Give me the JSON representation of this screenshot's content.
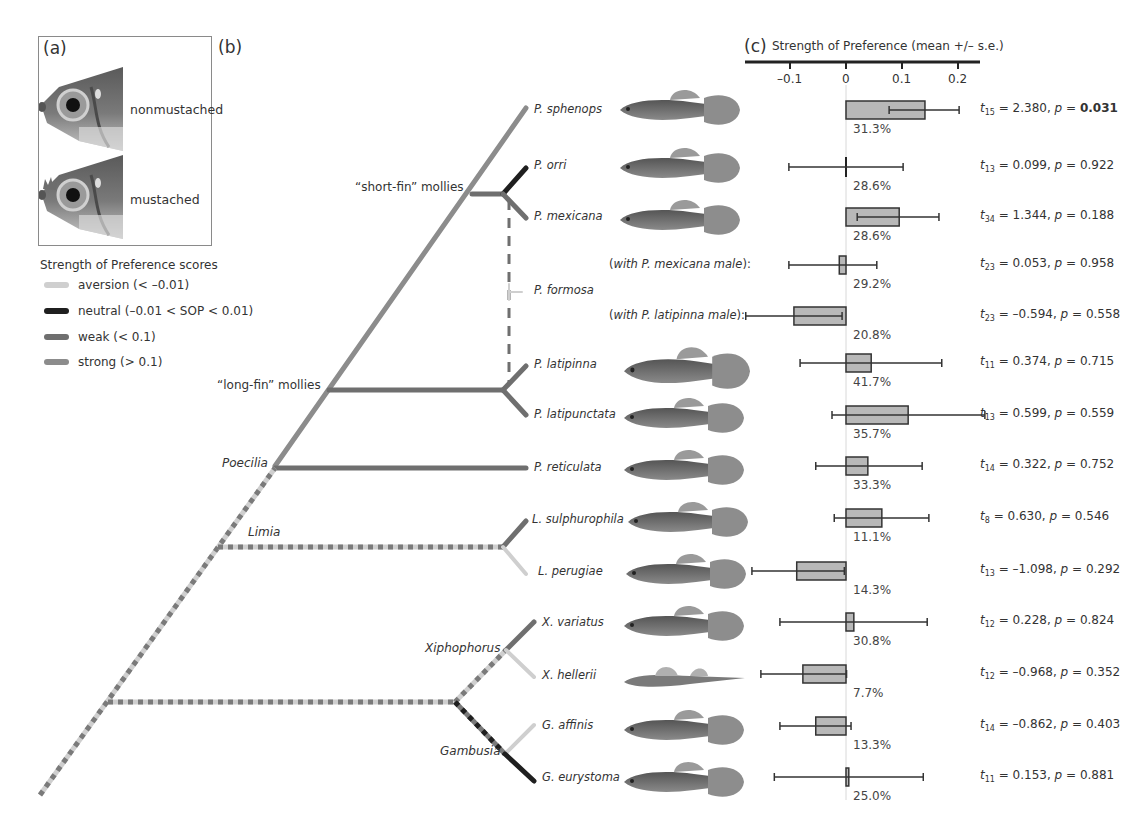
{
  "panels": {
    "a": {
      "label": "(a)",
      "images": [
        {
          "name": "nonmustached",
          "label": "nonmustached"
        },
        {
          "name": "mustached",
          "label": "mustached"
        }
      ]
    },
    "b": {
      "label": "(b)"
    },
    "c": {
      "label": "(c)",
      "axis_title": "Strength of Preference (mean +/– s.e.)"
    }
  },
  "legend": {
    "title": "Strength of Preference scores",
    "items": [
      {
        "key": "aversion",
        "label": "aversion (< –0.01)",
        "color": "#cfcfcf"
      },
      {
        "key": "neutral",
        "label": "neutral (–0.01 < SOP < 0.01)",
        "color": "#1f1f1f"
      },
      {
        "key": "weak",
        "label": "weak (< 0.1)",
        "color": "#6f6f6f"
      },
      {
        "key": "strong",
        "label": "strong (> 0.1)",
        "color": "#8c8c8c"
      }
    ]
  },
  "tree": {
    "clades": [
      {
        "label": "“short-fin” mollies",
        "italic": false
      },
      {
        "label": "“long-fin” mollies",
        "italic": false
      },
      {
        "label": "Poecilia",
        "italic": true
      },
      {
        "label": "Limia",
        "italic": true
      },
      {
        "label": "Xiphophorus",
        "italic": true
      },
      {
        "label": "Gambusia",
        "italic": true
      }
    ],
    "species": [
      "P. sphenops",
      "P. orri",
      "P. mexicana",
      "P. formosa",
      "P. latipinna",
      "P. latipunctata",
      "P. reticulata",
      "L. sulphurophila",
      "L. perugiae",
      "X. variatus",
      "X. hellerii",
      "G. affinis",
      "G. eurystoma"
    ],
    "formosa_subrows": [
      {
        "prefix": "(",
        "italic": "with P. mexicana male",
        "suffix": "):"
      },
      {
        "prefix": "(",
        "italic": "with P. latipinna male",
        "suffix": "):"
      }
    ]
  },
  "chart_data": {
    "type": "bar",
    "title": "Strength of Preference (mean +/– s.e.)",
    "xlabel": "Strength of Preference (mean +/– s.e.)",
    "ylabel": "",
    "orientation": "horizontal",
    "xlim": [
      -0.18,
      0.25
    ],
    "ticks": [
      -0.1,
      0,
      0.1,
      0.2
    ],
    "tick_labels": [
      "–0.1",
      "0",
      "0.1",
      "0.2"
    ],
    "grid": false,
    "categories": [
      "P. sphenops",
      "P. orri",
      "P. mexicana",
      "P. formosa (with P. mexicana male)",
      "P. formosa (with P. latipinna male)",
      "P. latipinna",
      "P. latipunctata",
      "P. reticulata",
      "L. sulphurophila",
      "L. perugiae",
      "X. variatus",
      "X. hellerii",
      "G. affinis",
      "G. eurystoma"
    ],
    "rows": [
      {
        "mean": 0.141,
        "lo": 0.077,
        "hi": 0.202,
        "pct": "31.3%",
        "df": "15",
        "t": "2.380",
        "p": "0.031",
        "sig": true
      },
      {
        "mean": 0.0,
        "lo": -0.102,
        "hi": 0.102,
        "pct": "28.6%",
        "df": "13",
        "t": "0.099",
        "p": "0.922",
        "sig": false
      },
      {
        "mean": 0.095,
        "lo": 0.02,
        "hi": 0.166,
        "pct": "28.6%",
        "df": "34",
        "t": "1.344",
        "p": "0.188",
        "sig": false
      },
      {
        "mean": -0.012,
        "lo": -0.102,
        "hi": 0.055,
        "pct": "29.2%",
        "df": "23",
        "t": "0.053",
        "p": "0.958",
        "sig": false
      },
      {
        "mean": -0.093,
        "lo": -0.179,
        "hi": -0.007,
        "pct": "20.8%",
        "df": "23",
        "t": "–0.594",
        "p": "0.558",
        "sig": false
      },
      {
        "mean": 0.045,
        "lo": -0.082,
        "hi": 0.171,
        "pct": "41.7%",
        "df": "11",
        "t": "0.374",
        "p": "0.715",
        "sig": false
      },
      {
        "mean": 0.111,
        "lo": -0.025,
        "hi": 0.248,
        "pct": "35.7%",
        "df": "13",
        "t": "0.599",
        "p": "0.559",
        "sig": false
      },
      {
        "mean": 0.039,
        "lo": -0.054,
        "hi": 0.136,
        "pct": "33.3%",
        "df": "14",
        "t": "0.322",
        "p": "0.752",
        "sig": false
      },
      {
        "mean": 0.064,
        "lo": -0.021,
        "hi": 0.148,
        "pct": "11.1%",
        "df": "8",
        "t": "0.630",
        "p": "0.546",
        "sig": false
      },
      {
        "mean": -0.088,
        "lo": -0.168,
        "hi": -0.003,
        "pct": "14.3%",
        "df": "13",
        "t": "–1.098",
        "p": "0.292",
        "sig": false
      },
      {
        "mean": 0.014,
        "lo": -0.118,
        "hi": 0.145,
        "pct": "30.8%",
        "df": "12",
        "t": "0.228",
        "p": "0.824",
        "sig": false
      },
      {
        "mean": -0.077,
        "lo": -0.152,
        "hi": 0.001,
        "pct": "7.7%",
        "df": "12",
        "t": "–0.968",
        "p": "0.352",
        "sig": false
      },
      {
        "mean": -0.054,
        "lo": -0.118,
        "hi": 0.009,
        "pct": "13.3%",
        "df": "14",
        "t": "–0.862",
        "p": "0.403",
        "sig": false
      },
      {
        "mean": 0.005,
        "lo": -0.128,
        "hi": 0.138,
        "pct": "25.0%",
        "df": "11",
        "t": "0.153",
        "p": "0.881",
        "sig": false
      }
    ],
    "values": [
      0.141,
      0.0,
      0.095,
      -0.012,
      -0.093,
      0.045,
      0.111,
      0.039,
      0.064,
      -0.088,
      0.014,
      -0.077,
      -0.054,
      0.005
    ]
  }
}
